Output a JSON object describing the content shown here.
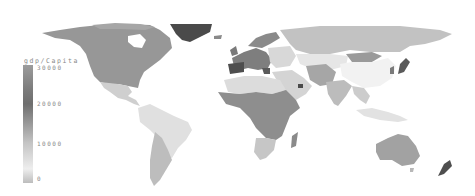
{
  "map": {
    "type": "choropleth-world",
    "colorscale": "grayscale",
    "background": "#ffffff"
  },
  "legend": {
    "title": "gdp/Capita",
    "ticks": [
      {
        "label": "30000",
        "y": 67
      },
      {
        "label": "20000",
        "y": 103
      },
      {
        "label": "10000",
        "y": 143
      },
      {
        "label": "0",
        "y": 178
      }
    ],
    "gradient_stops": [
      "#9c9c9c",
      "#6e6e6e",
      "#c4c4c4",
      "#eeeeee",
      "#bdbdbd"
    ]
  },
  "regions": [
    {
      "name": "North America (Canada/USA)",
      "color": "#979797"
    },
    {
      "name": "Mexico & Central America",
      "color": "#cfcfcf"
    },
    {
      "name": "Greenland",
      "color": "#4a4a4a"
    },
    {
      "name": "South America north/Brazil",
      "color": "#e0e0e0"
    },
    {
      "name": "Argentina/Chile",
      "color": "#bdbdbd"
    },
    {
      "name": "Western Europe",
      "color": "#7e7e7e"
    },
    {
      "name": "Iberia",
      "color": "#4e4e4e"
    },
    {
      "name": "Scandinavia",
      "color": "#8a8a8a"
    },
    {
      "name": "Eastern Europe",
      "color": "#d8d8d8"
    },
    {
      "name": "Russia",
      "color": "#c2c2c2"
    },
    {
      "name": "North Africa",
      "color": "#dcdcdc"
    },
    {
      "name": "Sub-Saharan Africa",
      "color": "#8e8e8e"
    },
    {
      "name": "Southern Africa",
      "color": "#c6c6c6"
    },
    {
      "name": "Madagascar",
      "color": "#8a8a8a"
    },
    {
      "name": "Middle East / Arabia",
      "color": "#d4d4d4"
    },
    {
      "name": "Central Asia",
      "color": "#e6e6e6"
    },
    {
      "name": "Mongolia",
      "color": "#9a9a9a"
    },
    {
      "name": "China",
      "color": "#f2f2f2"
    },
    {
      "name": "Iran/Pakistan",
      "color": "#a6a6a6"
    },
    {
      "name": "India",
      "color": "#bcbcbc"
    },
    {
      "name": "Southeast Asia",
      "color": "#cccccc"
    },
    {
      "name": "Japan",
      "color": "#5a5a5a"
    },
    {
      "name": "Indonesia",
      "color": "#e2e2e2"
    },
    {
      "name": "Australia",
      "color": "#a2a2a2"
    },
    {
      "name": "New Zealand",
      "color": "#4e4e4e"
    }
  ]
}
